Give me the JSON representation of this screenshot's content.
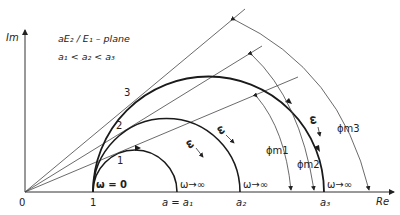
{
  "title_line1": "aE₂ / E₁ – plane",
  "title_line2": "a₁ < a₂ < a₃",
  "axes": {
    "x_label": "Re",
    "y_label": "Im",
    "origin_label": "0",
    "unit_label": "1"
  },
  "curves": [
    {
      "id": "1",
      "label": "1",
      "end_label": "a = a₁",
      "omega_label": "ω",
      "omega_inf": "ω→∞"
    },
    {
      "id": "2",
      "label": "2",
      "end_label": "a₂",
      "omega_label": "ω",
      "omega_inf": "ω→∞"
    },
    {
      "id": "3",
      "label": "3",
      "end_label": "a₃",
      "omega_label": "ω",
      "omega_inf": "ω→∞"
    }
  ],
  "start_label": "ω = 0",
  "phase_labels": {
    "m1": "ϕm1",
    "m2": "ϕm2",
    "m3": "ϕm3"
  },
  "colors": {
    "curve": "#1a1a1a",
    "line": "#444444",
    "background": "#ffffff"
  }
}
